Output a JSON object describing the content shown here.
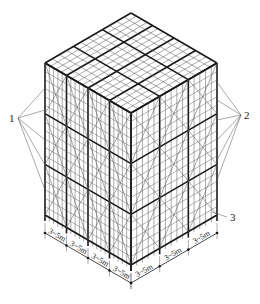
{
  "diagram": {
    "colors": {
      "line": "#1a1a1a",
      "thin": "#555555",
      "background": "#ffffff"
    },
    "geometry": {
      "top": [
        131,
        13
      ],
      "left_top": [
        45,
        63
      ],
      "right_top": [
        217,
        63
      ],
      "front_top": [
        131,
        113
      ],
      "height": 152,
      "left_bays": 4,
      "right_bays": 3,
      "top_grid": [
        4,
        3
      ],
      "levels": 3
    },
    "callouts": [
      {
        "id": "1",
        "label": "1",
        "x": 13,
        "y": 122,
        "targets": [
          [
            45,
            88
          ],
          [
            45,
            110
          ],
          [
            45,
            140
          ],
          [
            45,
            165
          ],
          [
            45,
            190
          ]
        ]
      },
      {
        "id": "2",
        "label": "2",
        "x": 244,
        "y": 119,
        "targets": [
          [
            217,
            82
          ],
          [
            217,
            100
          ],
          [
            217,
            120
          ],
          [
            217,
            140
          ],
          [
            217,
            160
          ],
          [
            217,
            180
          ]
        ]
      },
      {
        "id": "3",
        "label": "3",
        "x": 230,
        "y": 221,
        "targets": [
          [
            212,
            212
          ]
        ]
      }
    ],
    "dimensions": {
      "left": [
        "3~5m",
        "3~5m",
        "3~5m",
        "3~5m"
      ],
      "right": [
        "3~5m",
        "3~5m",
        "3~5m"
      ]
    }
  }
}
